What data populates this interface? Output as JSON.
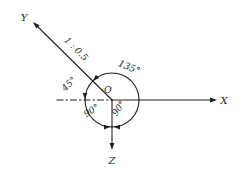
{
  "colors": {
    "ink": "#1f1f1f",
    "background": "#ffffff"
  },
  "diagram": {
    "type": "axonometric-axes-angle-diagram",
    "labels": {
      "axis_y": "Y",
      "axis_x": "X",
      "axis_z": "Z",
      "origin": "O",
      "y_axis_scale": "1 : 0.5",
      "angle_y_to_x": "135°",
      "angle_y_to_horizontal": "45°",
      "angle_horizontal_to_z": "90°",
      "angle_z_to_x": "90°"
    }
  }
}
